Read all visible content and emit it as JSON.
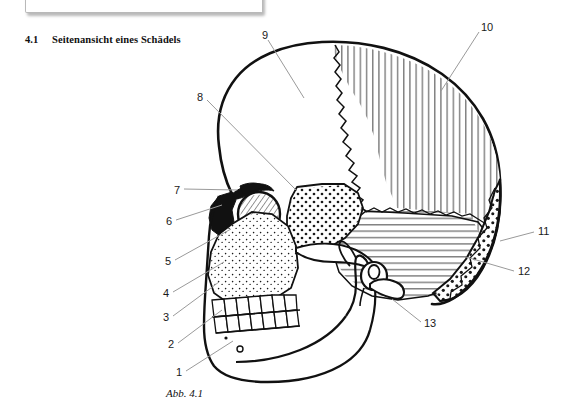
{
  "document": {
    "section_number": "4.1",
    "section_title": "Seitenansicht eines Schädels",
    "figure_caption": "Abb. 4.1"
  },
  "figure": {
    "name": "lateral-view-of-skull-diagram",
    "callouts": [
      {
        "id": "1",
        "label": "1",
        "x": 176,
        "y": 373,
        "anchor_x": 233,
        "anchor_y": 341
      },
      {
        "id": "2",
        "label": "2",
        "x": 168,
        "y": 345,
        "anchor_x": 222,
        "anchor_y": 310
      },
      {
        "id": "3",
        "label": "3",
        "x": 163,
        "y": 318,
        "anchor_x": 219,
        "anchor_y": 282
      },
      {
        "id": "4",
        "label": "4",
        "x": 163,
        "y": 294,
        "anchor_x": 224,
        "anchor_y": 262
      },
      {
        "id": "5",
        "label": "5",
        "x": 165,
        "y": 262,
        "anchor_x": 231,
        "anchor_y": 229
      },
      {
        "id": "6",
        "label": "6",
        "x": 166,
        "y": 222,
        "anchor_x": 222,
        "anchor_y": 205
      },
      {
        "id": "7",
        "label": "7",
        "x": 174,
        "y": 191,
        "anchor_x": 237,
        "anchor_y": 190
      },
      {
        "id": "8",
        "label": "8",
        "x": 197,
        "y": 96,
        "anchor_x": 297,
        "anchor_y": 191
      },
      {
        "id": "9",
        "label": "9",
        "x": 262,
        "y": 33,
        "anchor_x": 304,
        "anchor_y": 98
      },
      {
        "id": "10",
        "label": "10",
        "x": 483,
        "y": 25,
        "anchor_x": 441,
        "anchor_y": 91
      },
      {
        "id": "11",
        "label": "11",
        "x": 538,
        "y": 229,
        "anchor_x": 500,
        "anchor_y": 241
      },
      {
        "id": "12",
        "label": "12",
        "x": 518,
        "y": 270,
        "anchor_x": 470,
        "anchor_y": 255
      },
      {
        "id": "13",
        "label": "13",
        "x": 424,
        "y": 322,
        "anchor_x": 392,
        "anchor_y": 299
      }
    ],
    "regions": [
      {
        "name": "frontal-bone",
        "fill": "plain-white"
      },
      {
        "name": "parietal-bone",
        "fill": "vertical-hatch"
      },
      {
        "name": "temporal-bone",
        "fill": "horizontal-hatch"
      },
      {
        "name": "occipital-bone",
        "fill": "coarse-stipple"
      },
      {
        "name": "sphenoid-bone",
        "fill": "coarse-stipple"
      },
      {
        "name": "zygomatic-maxilla",
        "fill": "fine-stipple"
      },
      {
        "name": "lacrimal-bone",
        "fill": "diagonal-hatch"
      },
      {
        "name": "nasal-aperture",
        "fill": "solid-black"
      }
    ]
  },
  "colors": {
    "ink": "#111111",
    "leader_line": "#9a9a9a",
    "frame_border": "#b9b9b9",
    "page_background": "#ffffff"
  }
}
